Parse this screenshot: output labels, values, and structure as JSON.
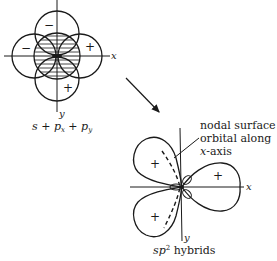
{
  "left_figure": {
    "caption": {
      "s": "s",
      "plus1": " + ",
      "px": "p",
      "px_sub": "x",
      "plus2": " + ",
      "py": "p",
      "py_sub": "y"
    },
    "x_axis_label": "x",
    "y_axis_label": "y",
    "signs": {
      "top": "−",
      "left": "−",
      "right": "+",
      "bottom": "+"
    }
  },
  "arrow": {
    "direction": "down-right"
  },
  "right_figure": {
    "caption": {
      "sp": "sp",
      "sup": "2",
      "rest": " hybrids"
    },
    "x_axis_label": "x",
    "y_axis_label": "y",
    "signs": {
      "upper_left": "+",
      "lower_left": "+",
      "right": "+"
    },
    "annotation": {
      "line1": "nodal surface of",
      "line2": "orbital along",
      "line3_italic": "x",
      "line3_rest": "-axis"
    }
  },
  "colors": {
    "ink": "#1a1a1a",
    "background": "#ffffff"
  }
}
